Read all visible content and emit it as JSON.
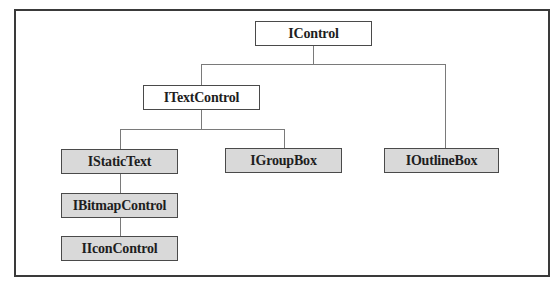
{
  "diagram": {
    "type": "class-hierarchy",
    "root": "IControl",
    "nodes": [
      {
        "id": "icontrol",
        "label": "IControl",
        "shaded": false,
        "parent": null
      },
      {
        "id": "itextcontrol",
        "label": "ITextControl",
        "shaded": false,
        "parent": "IControl"
      },
      {
        "id": "ioutlinebox",
        "label": "IOutlineBox",
        "shaded": true,
        "parent": "IControl"
      },
      {
        "id": "istatictext",
        "label": "IStaticText",
        "shaded": true,
        "parent": "ITextControl"
      },
      {
        "id": "igroupbox",
        "label": "IGroupBox",
        "shaded": true,
        "parent": "ITextControl"
      },
      {
        "id": "ibitmapcontrol",
        "label": "IBitmapControl",
        "shaded": true,
        "parent": "IStaticText"
      },
      {
        "id": "iiconcontrol",
        "label": "IIconControl",
        "shaded": true,
        "parent": "IBitmapControl"
      }
    ],
    "colors": {
      "shaded_fill": "#d9d9d9",
      "plain_fill": "#ffffff",
      "border": "#4a4a4a",
      "connector": "#7a7a7a",
      "frame": "#3a3a3a"
    }
  }
}
